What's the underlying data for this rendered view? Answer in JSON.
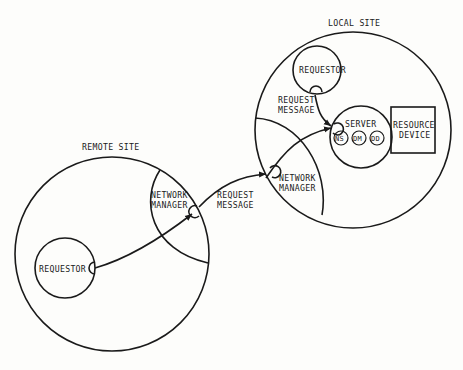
{
  "local_site": {
    "label": "LOCAL SITE",
    "requestor": "REQUESTOR",
    "request_message": [
      "REQUEST",
      "MESSAGE"
    ],
    "server": {
      "label": "SERVER",
      "components": [
        "NS",
        "DM",
        "DD"
      ]
    },
    "resource_device": [
      "RESOURCE",
      "DEVICE"
    ],
    "network_manager": [
      "NETWORK",
      "MANAGER"
    ]
  },
  "remote_site": {
    "label": "REMOTE SITE",
    "requestor": "REQUESTOR",
    "network_manager": [
      "NETWORK",
      "MANAGER"
    ]
  },
  "inter_site": {
    "request_message": [
      "REQUEST",
      "MESSAGE"
    ]
  }
}
